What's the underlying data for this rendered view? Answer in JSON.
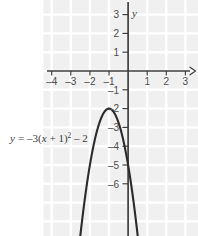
{
  "figure": {
    "name": "parabola-graph",
    "background_color": "#ffffff",
    "plot_area_color": "#f0f0f0",
    "grid_line_color": "#ffffff",
    "axis_color": "#3d3d3d",
    "curve_color": "#2b2b2b",
    "text_color": "#3a3a3a"
  },
  "axis_labels": {
    "y_axis_label": "y",
    "x_axis_label": ""
  },
  "equation": {
    "lhs": "y",
    "equals": "=",
    "coefficient": "–3(",
    "variable": "x",
    "inner": " + 1)",
    "exponent": "2",
    "constant": " – 2"
  },
  "equation_plain": "y = –3(x + 1)² – 2",
  "chart_data": {
    "type": "line",
    "title": "",
    "subtitle": "",
    "xlabel": "x",
    "ylabel": "y",
    "xlim": [
      -5,
      3.8
    ],
    "ylim": [
      -8.6,
      3.9
    ],
    "grid": true,
    "grid_step": 1,
    "legend": "none",
    "annotations": [
      {
        "text": "y = –3(x + 1)² – 2",
        "x": -4.6,
        "y": -4.0
      }
    ],
    "xticks": [
      -4,
      -3,
      -2,
      -1,
      1,
      2,
      3
    ],
    "xticklabels": [
      "–4",
      "–3",
      "–2",
      "–1",
      "1",
      "2",
      "3"
    ],
    "yticks": [
      3,
      2,
      1,
      -1,
      -2,
      -3,
      -4,
      -5,
      -6
    ],
    "yticklabels": [
      "3",
      "2",
      "1",
      "–1",
      "–2",
      "–3",
      "–4",
      "–5",
      "–6"
    ],
    "series": [
      {
        "name": "y = -3(x + 1)^2 - 2",
        "equation": "y = -3*(x + 1)^2 - 2",
        "vertex": [
          -1,
          -2
        ],
        "a": -3,
        "h": -1,
        "k": -2,
        "opens": "down",
        "points": [
          [
            -2.55,
            -9.2
          ],
          [
            -2.4,
            -7.88
          ],
          [
            -2.2,
            -6.32
          ],
          [
            -2.0,
            -5.0
          ],
          [
            -1.8,
            -3.92
          ],
          [
            -1.6,
            -3.08
          ],
          [
            -1.4,
            -2.48
          ],
          [
            -1.2,
            -2.12
          ],
          [
            -1.0,
            -2.0
          ],
          [
            -0.8,
            -2.12
          ],
          [
            -0.6,
            -2.48
          ],
          [
            -0.4,
            -3.08
          ],
          [
            -0.2,
            -3.92
          ],
          [
            0.0,
            -5.0
          ],
          [
            0.2,
            -6.32
          ],
          [
            0.4,
            -7.88
          ],
          [
            0.55,
            -9.2
          ]
        ]
      }
    ]
  }
}
